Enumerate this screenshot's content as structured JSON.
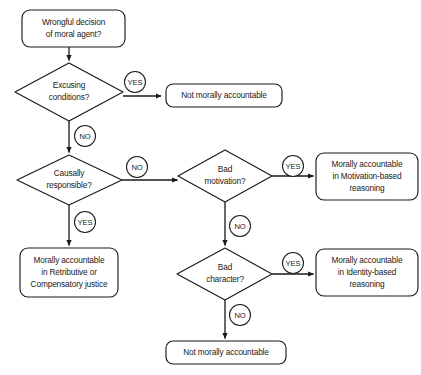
{
  "diagram": {
    "background_color": "#ffffff",
    "stroke_color": "#1a1a1a",
    "nodes": {
      "start": {
        "shape": "rounded-rectangle",
        "line1": "Wrongful decision",
        "line2": "of moral agent?"
      },
      "excusing": {
        "shape": "diamond",
        "line1": "Excusing",
        "line2": "conditions?"
      },
      "not_accountable_top": {
        "shape": "rounded-rectangle",
        "line1": "Not morally accountable"
      },
      "causally": {
        "shape": "diamond",
        "line1": "Causally",
        "line2": "responsible?"
      },
      "retributive": {
        "shape": "rounded-rectangle",
        "line1": "Morally accountable",
        "line2": "in Retributive or",
        "line3": "Compensatory justice"
      },
      "bad_motivation": {
        "shape": "diamond",
        "line1": "Bad",
        "line2": "motivation?"
      },
      "motivation_based": {
        "shape": "rounded-rectangle",
        "line1": "Morally accountable",
        "line2": "in Motivation-based",
        "line3": "reasoning"
      },
      "bad_character": {
        "shape": "diamond",
        "line1": "Bad",
        "line2": "character?"
      },
      "identity_based": {
        "shape": "rounded-rectangle",
        "line1": "Morally accountable",
        "line2": "in Identity-based",
        "line3": "reasoning"
      },
      "not_accountable_bottom": {
        "shape": "rounded-rectangle",
        "line1": "Not morally accountable"
      }
    },
    "edge_labels": {
      "excusing_yes": "YES",
      "excusing_no": "NO",
      "causally_no": "NO",
      "causally_yes": "YES",
      "motivation_yes": "YES",
      "motivation_no": "NO",
      "character_yes": "YES",
      "character_no": "NO"
    }
  }
}
